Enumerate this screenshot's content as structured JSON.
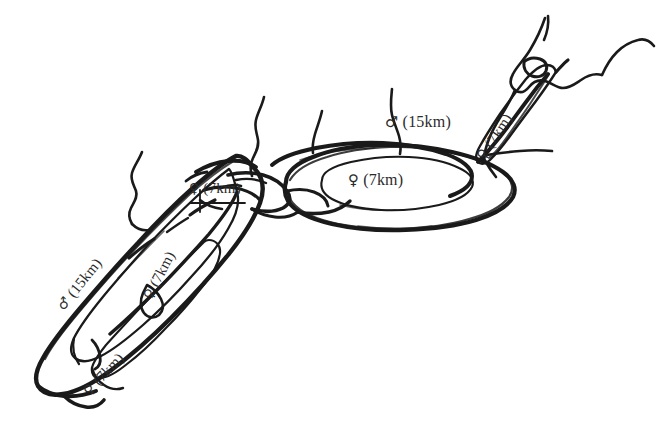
{
  "figure": {
    "type": "hand-drawn-map-diagram",
    "background_color": "#ffffff",
    "ink_color": "#1a1a1a",
    "label_color": "#2b2b2b"
  },
  "symbols": {
    "male": "♂",
    "female": "♀"
  },
  "labels": [
    {
      "id": "center-female",
      "sex": "female",
      "sex_symbol": "♀",
      "distance": "(7km)",
      "text": "♀ (7km)",
      "rotation_deg": 0,
      "region": "central-ellipse"
    },
    {
      "id": "top-male",
      "sex": "male",
      "sex_symbol": "♂",
      "distance": "(15km)",
      "text": "♂ (15km)",
      "rotation_deg": 0,
      "region": "outer-ellipse-top"
    },
    {
      "id": "left-female",
      "sex": "female",
      "sex_symbol": "♀",
      "distance": "(7km)",
      "text": "♀ (7km)",
      "rotation_deg": 0,
      "region": "left-junction"
    },
    {
      "id": "ne-female",
      "sex": "female",
      "sex_symbol": "♀",
      "distance": "(7km)",
      "text": "♀ (7km)",
      "rotation_deg": -56,
      "region": "northeast-lobe"
    },
    {
      "id": "sw-male",
      "sex": "male",
      "sex_symbol": "♂",
      "distance": "(15km)",
      "text": "♂ (15km)",
      "rotation_deg": -51,
      "region": "southwest-outer-lobe"
    },
    {
      "id": "sw-female-1",
      "sex": "female",
      "sex_symbol": "♀",
      "distance": "(7km)",
      "text": "♀ (7km)",
      "rotation_deg": -62,
      "region": "southwest-middle-lobe"
    },
    {
      "id": "sw-female-2",
      "sex": "female",
      "sex_symbol": "♀",
      "distance": "(7km)",
      "text": "♀ (7km)",
      "rotation_deg": -47,
      "region": "southwest-inner-lobe"
    }
  ]
}
